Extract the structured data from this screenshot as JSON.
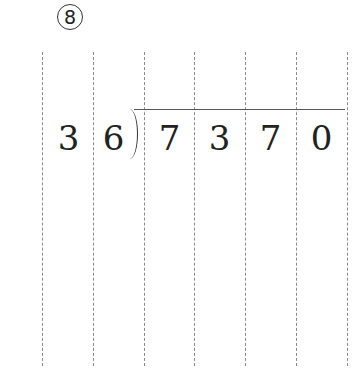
{
  "problem": {
    "number": "8",
    "divisor": [
      "3",
      "6"
    ],
    "dividend": [
      "7",
      "3",
      "7",
      "0"
    ]
  },
  "guides": {
    "count": 7,
    "color": "#8a8a8a"
  }
}
